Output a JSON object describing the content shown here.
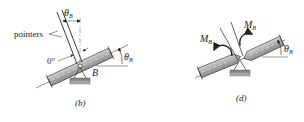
{
  "figure_b": {
    "caption": "(b)",
    "pointers_label": "pointers",
    "zero_label": "0°",
    "theta_top": "θ",
    "theta_top_sub": "B",
    "theta_right": "θ",
    "theta_right_sub": "B",
    "support_label": "B"
  },
  "figure_d": {
    "caption": "(d)",
    "moment_left": "M",
    "moment_left_sub": "B",
    "moment_right": "M",
    "moment_right_sub": "B",
    "theta_right": "θ",
    "theta_right_sub": "B"
  },
  "colors": {
    "beam_fill": "#b5b5b5",
    "beam_stroke": "#333333",
    "line": "#222222",
    "support_fill": "#8c8c8c"
  }
}
